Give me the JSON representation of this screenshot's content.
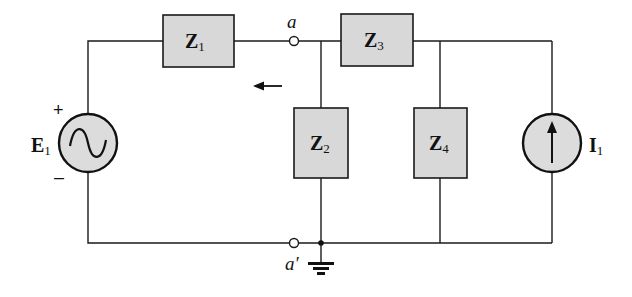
{
  "diagram": {
    "type": "circuit-schematic",
    "background": "#ffffff",
    "component_fill": "#d8d8d8",
    "components": [
      {
        "id": "Z1",
        "symbol": "Z",
        "subscript": "1",
        "kind": "impedance"
      },
      {
        "id": "Z2",
        "symbol": "Z",
        "subscript": "2",
        "kind": "impedance"
      },
      {
        "id": "Z3",
        "symbol": "Z",
        "subscript": "3",
        "kind": "impedance"
      },
      {
        "id": "Z4",
        "symbol": "Z",
        "subscript": "4",
        "kind": "impedance"
      },
      {
        "id": "E1",
        "symbol": "E",
        "subscript": "1",
        "kind": "ac-voltage-source",
        "polarity_plus": "+",
        "polarity_minus": "–"
      },
      {
        "id": "I1",
        "symbol": "I",
        "subscript": "1",
        "kind": "current-source",
        "direction": "up"
      }
    ],
    "terminals": [
      {
        "id": "a",
        "label": "a"
      },
      {
        "id": "a_prime",
        "label": "a′"
      }
    ],
    "annotations": {
      "arrow_direction": "left"
    }
  }
}
